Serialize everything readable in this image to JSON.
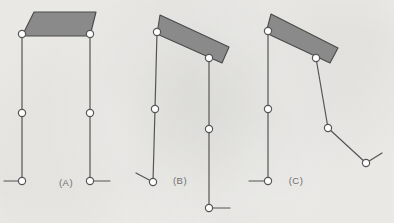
{
  "figure": {
    "background_color": "#f2f1ee",
    "stroke_color": "#555555",
    "coupler_fill": "#8a8a8a",
    "coupler_stroke": "#4a4a4a",
    "joint_fill": "#ffffff",
    "label_color": "#6f6f6f",
    "panel_count": 3
  },
  "panels": [
    {
      "id": "A",
      "label": "(A)",
      "label_x": 66,
      "label_y": 186,
      "description": "Coupler horizontal, both cranks vertical and parallel",
      "coupler": {
        "name": "coupler-plate",
        "points": "34,12 96,12 90,36 22,36",
        "fill": "#8a8a8a"
      },
      "links": [
        {
          "name": "left-crank-upper",
          "x1": 22,
          "y1": 34,
          "x2": 22,
          "y2": 113
        },
        {
          "name": "left-crank-lower",
          "x1": 22,
          "y1": 113,
          "x2": 22,
          "y2": 181
        },
        {
          "name": "left-ground-stub",
          "x1": 22,
          "y1": 181,
          "x2": 4,
          "y2": 181
        },
        {
          "name": "right-crank-upper",
          "x1": 90,
          "y1": 34,
          "x2": 90,
          "y2": 113
        },
        {
          "name": "right-crank-lower",
          "x1": 90,
          "y1": 113,
          "x2": 90,
          "y2": 181
        },
        {
          "name": "right-ground-stub",
          "x1": 90,
          "y1": 181,
          "x2": 110,
          "y2": 181
        }
      ],
      "joints": [
        {
          "name": "joint-left-top",
          "cx": 22,
          "cy": 34,
          "r": 3.6
        },
        {
          "name": "joint-right-top",
          "cx": 90,
          "cy": 34,
          "r": 3.6
        },
        {
          "name": "joint-left-middle",
          "cx": 22,
          "cy": 113,
          "r": 3.6
        },
        {
          "name": "joint-right-middle",
          "cx": 90,
          "cy": 113,
          "r": 3.6
        },
        {
          "name": "joint-left-bottom",
          "cx": 22,
          "cy": 181,
          "r": 3.6
        },
        {
          "name": "joint-right-bottom",
          "cx": 90,
          "cy": 181,
          "r": 3.6
        }
      ]
    },
    {
      "id": "B",
      "label": "(B)",
      "label_x": 180,
      "label_y": 184,
      "description": "Coupler tilted clockwise, right crank displaced downward",
      "coupler": {
        "name": "coupler-plate",
        "points": "160,15 229,47 222,63 157,34",
        "fill": "#8a8a8a"
      },
      "links": [
        {
          "name": "left-crank-upper",
          "x1": 157,
          "y1": 32,
          "x2": 155,
          "y2": 109
        },
        {
          "name": "left-crank-lower",
          "x1": 155,
          "y1": 109,
          "x2": 153,
          "y2": 182
        },
        {
          "name": "left-ground-stub",
          "x1": 153,
          "y1": 182,
          "x2": 136,
          "y2": 173
        },
        {
          "name": "right-crank-upper",
          "x1": 209,
          "y1": 58,
          "x2": 209,
          "y2": 129
        },
        {
          "name": "right-crank-lower",
          "x1": 209,
          "y1": 129,
          "x2": 209,
          "y2": 208
        },
        {
          "name": "right-ground-stub",
          "x1": 209,
          "y1": 208,
          "x2": 230,
          "y2": 208
        }
      ],
      "joints": [
        {
          "name": "joint-left-top",
          "cx": 157,
          "cy": 32,
          "r": 3.6
        },
        {
          "name": "joint-right-top",
          "cx": 209,
          "cy": 58,
          "r": 3.6
        },
        {
          "name": "joint-left-middle",
          "cx": 155,
          "cy": 109,
          "r": 3.6
        },
        {
          "name": "joint-right-middle",
          "cx": 209,
          "cy": 129,
          "r": 3.6
        },
        {
          "name": "joint-left-bottom",
          "cx": 153,
          "cy": 182,
          "r": 3.6
        },
        {
          "name": "joint-right-bottom",
          "cx": 209,
          "cy": 208,
          "r": 3.6
        }
      ]
    },
    {
      "id": "C",
      "label": "(C)",
      "label_x": 296,
      "label_y": 184,
      "description": "Coupler tilted further, right linkage folded outward to the right",
      "coupler": {
        "name": "coupler-plate",
        "points": "271,14 338,48 330,63 266,33",
        "fill": "#8a8a8a"
      },
      "links": [
        {
          "name": "left-crank-upper",
          "x1": 268,
          "y1": 31,
          "x2": 268,
          "y2": 109
        },
        {
          "name": "left-crank-lower",
          "x1": 268,
          "y1": 109,
          "x2": 268,
          "y2": 181
        },
        {
          "name": "left-ground-stub",
          "x1": 268,
          "y1": 181,
          "x2": 249,
          "y2": 181
        },
        {
          "name": "right-crank-upper",
          "x1": 316,
          "y1": 58,
          "x2": 328,
          "y2": 128
        },
        {
          "name": "right-crank-lower",
          "x1": 328,
          "y1": 128,
          "x2": 366,
          "y2": 163
        },
        {
          "name": "right-ground-stub",
          "x1": 366,
          "y1": 163,
          "x2": 382,
          "y2": 153
        }
      ],
      "joints": [
        {
          "name": "joint-left-top",
          "cx": 268,
          "cy": 31,
          "r": 3.6
        },
        {
          "name": "joint-right-top",
          "cx": 316,
          "cy": 58,
          "r": 3.6
        },
        {
          "name": "joint-left-middle",
          "cx": 268,
          "cy": 109,
          "r": 3.6
        },
        {
          "name": "joint-right-middle",
          "cx": 328,
          "cy": 128,
          "r": 3.6
        },
        {
          "name": "joint-left-bottom",
          "cx": 268,
          "cy": 181,
          "r": 3.6
        },
        {
          "name": "joint-right-bottom",
          "cx": 366,
          "cy": 163,
          "r": 3.6
        }
      ]
    }
  ]
}
